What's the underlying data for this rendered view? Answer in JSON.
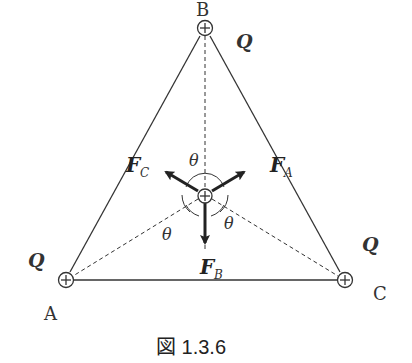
{
  "diagram": {
    "type": "triangle-charges-forces",
    "vertices": {
      "A": {
        "label": "A",
        "charge": "Q"
      },
      "B": {
        "label": "B",
        "charge": "Q"
      },
      "C": {
        "label": "C",
        "charge": "Q"
      }
    },
    "center_charge_symbol": "+",
    "forces": {
      "FA": {
        "main": "F",
        "sub": "A"
      },
      "FB": {
        "main": "F",
        "sub": "B"
      },
      "FC": {
        "main": "F",
        "sub": "C"
      }
    },
    "angle_label": "θ",
    "caption": "図 1.3.6"
  }
}
